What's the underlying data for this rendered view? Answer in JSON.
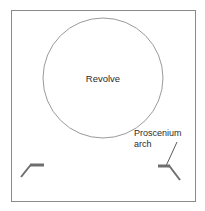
{
  "figure": {
    "width": 205,
    "height": 211,
    "background_color": "#ffffff"
  },
  "frame": {
    "name": "stage-outline",
    "x": 11,
    "y": 10,
    "width": 185,
    "height": 192,
    "stroke_color": "#8a8a8a",
    "fill_color": "#ffffff",
    "stroke_width": 1
  },
  "revolve": {
    "label": "Revolve",
    "center_x": 103,
    "center_y": 78,
    "radius": 60,
    "stroke_color": "#9a9a9a",
    "fill_color": "#ffffff",
    "stroke_width": 1,
    "label_x": 103,
    "label_y": 82
  },
  "callout": {
    "label_line_1": "Proscenium",
    "label_line_2": "arch",
    "label_x": 134,
    "label_y_line_1": 136,
    "label_y_line_2": 147,
    "text_color": "#2b2b2b",
    "leader_line": {
      "x1": 177,
      "y1": 142,
      "x2": 166,
      "y2": 166,
      "stroke_color": "#5a5a5a",
      "stroke_width": 1
    }
  },
  "proscenium_marks": [
    {
      "name": "proscenium-arch-mark-left",
      "side": "left",
      "bar_x1": 44,
      "bar_x2": 30,
      "bar_y": 165,
      "bar_thickness": 3,
      "diagonal_x2": 21,
      "diagonal_y2": 177,
      "stroke_color": "#6e6e6e"
    },
    {
      "name": "proscenium-arch-mark-right",
      "side": "right",
      "bar_x1": 158,
      "bar_x2": 170,
      "bar_y": 166,
      "bar_thickness": 3,
      "diagonal_x2": 180,
      "diagonal_y2": 180,
      "stroke_color": "#6e6e6e"
    }
  ],
  "colors": {
    "frame_stroke": "#8a8a8a",
    "circle_stroke": "#9a9a9a",
    "mark_stroke": "#6e6e6e",
    "text": "#2b2b2b",
    "canvas": "#ffffff"
  }
}
